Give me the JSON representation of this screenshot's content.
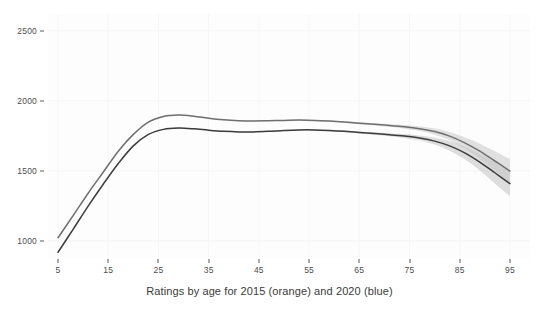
{
  "chart_data": {
    "type": "line",
    "title": "",
    "xlabel": "Ratings by age for 2015 (orange) and 2020 (blue)",
    "ylabel": "",
    "xlim": [
      3,
      99
    ],
    "ylim": [
      870,
      2620
    ],
    "grid": true,
    "legend_position": "none",
    "x_ticks": [
      5,
      15,
      25,
      35,
      45,
      55,
      65,
      75,
      85,
      95
    ],
    "y_ticks": [
      1000,
      1500,
      2000,
      2500
    ],
    "x_tick_labels": [
      "5",
      "15",
      "25",
      "35",
      "45",
      "55",
      "65",
      "75",
      "85",
      "95"
    ],
    "y_tick_labels": [
      "1000",
      "1500",
      "2000",
      "2500"
    ],
    "series": [
      {
        "name": "2015 (orange)",
        "color": "#6f6f6f",
        "band_color": "#c9c9c9",
        "x": [
          5,
          8,
          11,
          14,
          17,
          20,
          23,
          26,
          29,
          32,
          35,
          38,
          41,
          44,
          47,
          50,
          53,
          56,
          59,
          62,
          65,
          68,
          71,
          74,
          77,
          80,
          83,
          86,
          89,
          92,
          95
        ],
        "y": [
          1022,
          1180,
          1340,
          1490,
          1640,
          1760,
          1848,
          1888,
          1898,
          1890,
          1875,
          1864,
          1858,
          1856,
          1858,
          1860,
          1862,
          1860,
          1855,
          1848,
          1840,
          1832,
          1824,
          1814,
          1800,
          1780,
          1748,
          1700,
          1640,
          1570,
          1498
        ],
        "band_lower": [
          1022,
          1180,
          1340,
          1490,
          1638,
          1757,
          1845,
          1885,
          1895,
          1887,
          1872,
          1861,
          1855,
          1853,
          1855,
          1857,
          1858,
          1856,
          1850,
          1842,
          1833,
          1824,
          1814,
          1801,
          1784,
          1758,
          1718,
          1660,
          1586,
          1500,
          1412
        ],
        "band_upper": [
          1022,
          1182,
          1342,
          1492,
          1642,
          1763,
          1851,
          1891,
          1901,
          1893,
          1878,
          1867,
          1861,
          1859,
          1861,
          1863,
          1866,
          1864,
          1860,
          1854,
          1847,
          1840,
          1834,
          1827,
          1816,
          1802,
          1778,
          1740,
          1694,
          1640,
          1584
        ]
      },
      {
        "name": "2020 (blue)",
        "color": "#3c3c3c",
        "band_color": "#c2c2c2",
        "x": [
          5,
          8,
          11,
          14,
          17,
          20,
          23,
          26,
          29,
          32,
          35,
          38,
          41,
          44,
          47,
          50,
          53,
          56,
          59,
          62,
          65,
          68,
          71,
          74,
          77,
          80,
          83,
          86,
          89,
          92,
          95
        ],
        "y": [
          918,
          1082,
          1248,
          1404,
          1552,
          1678,
          1760,
          1796,
          1805,
          1800,
          1790,
          1782,
          1778,
          1778,
          1782,
          1788,
          1792,
          1792,
          1788,
          1782,
          1774,
          1766,
          1758,
          1748,
          1734,
          1712,
          1678,
          1628,
          1562,
          1486,
          1408
        ],
        "band_lower": [
          918,
          1082,
          1248,
          1402,
          1550,
          1675,
          1757,
          1793,
          1802,
          1797,
          1787,
          1779,
          1775,
          1775,
          1779,
          1785,
          1788,
          1788,
          1783,
          1776,
          1767,
          1757,
          1747,
          1734,
          1716,
          1688,
          1644,
          1582,
          1502,
          1410,
          1318
        ],
        "band_upper": [
          918,
          1084,
          1250,
          1406,
          1554,
          1681,
          1763,
          1799,
          1808,
          1803,
          1793,
          1785,
          1781,
          1781,
          1785,
          1791,
          1796,
          1796,
          1793,
          1788,
          1781,
          1775,
          1769,
          1762,
          1752,
          1736,
          1712,
          1674,
          1622,
          1562,
          1498
        ]
      }
    ]
  }
}
